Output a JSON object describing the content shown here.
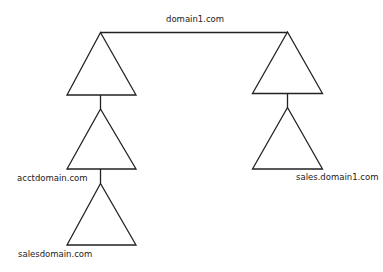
{
  "diagram": {
    "nodes": [
      {
        "id": "domain1",
        "label": "domain1.com"
      },
      {
        "id": "acctdomain",
        "label": "acctdomain.com"
      },
      {
        "id": "salesdomain",
        "label": "salesdomain.com"
      },
      {
        "id": "sales_domain1",
        "label": "sales.domain1.com"
      }
    ],
    "edges": [
      {
        "from": "domain1-left-tree",
        "to": "domain1-right-tree",
        "type": "trust"
      },
      {
        "from": "domain1-left-tree",
        "to": "acctdomain",
        "type": "parent-child"
      },
      {
        "from": "acctdomain",
        "to": "salesdomain",
        "type": "parent-child"
      },
      {
        "from": "domain1-right-tree",
        "to": "sales_domain1",
        "type": "parent-child"
      }
    ],
    "colors": {
      "stroke": "#222222",
      "background": "#ffffff",
      "text": "#222222"
    }
  }
}
